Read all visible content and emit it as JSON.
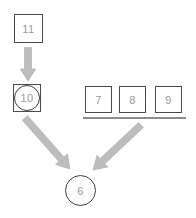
{
  "diagram": {
    "nodes": {
      "n11": {
        "label": "11",
        "shape": "square"
      },
      "n10": {
        "label": "10",
        "shape": "circle-in-square"
      },
      "n7": {
        "label": "7",
        "shape": "square"
      },
      "n8": {
        "label": "8",
        "shape": "square"
      },
      "n9": {
        "label": "9",
        "shape": "square"
      },
      "n6": {
        "label": "6",
        "shape": "circle"
      }
    },
    "groups": [
      {
        "members": [
          "n7",
          "n8",
          "n9"
        ],
        "marker": "underline"
      }
    ],
    "edges": [
      {
        "from": "n11",
        "to": "n10",
        "style": "thick-gray-arrow",
        "direction": "down"
      },
      {
        "from": "n10",
        "to": "n6",
        "style": "thick-gray-arrow",
        "direction": "down-right"
      },
      {
        "from": "n7-n8-n9-group",
        "to": "n6",
        "style": "thick-gray-arrow",
        "direction": "down-left"
      }
    ],
    "colors": {
      "background": "#ffffff",
      "node_border": "#4a4a4a",
      "label_text": "#9b9b9b",
      "arrow_fill": "#bdbdbd",
      "underline": "#8c8c8c"
    }
  }
}
